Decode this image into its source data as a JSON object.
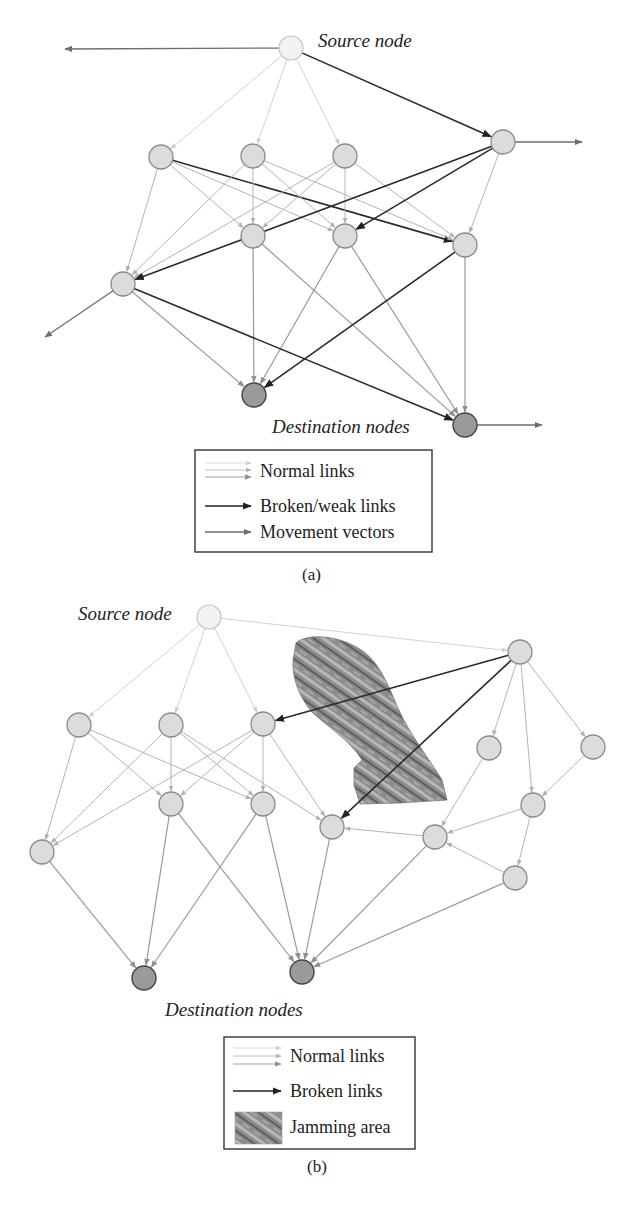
{
  "figure": {
    "panels": [
      {
        "id": "a",
        "caption": "(a)",
        "source_label": "Source node",
        "destination_label": "Destination nodes",
        "legend": {
          "items": [
            {
              "type": "normal",
              "label": "Normal links"
            },
            {
              "type": "broken",
              "label": "Broken/weak links"
            },
            {
              "type": "movement",
              "label": "Movement vectors"
            }
          ]
        }
      },
      {
        "id": "b",
        "caption": "(b)",
        "source_label": "Source node",
        "destination_label": "Destination nodes",
        "legend": {
          "items": [
            {
              "type": "normal",
              "label": "Normal links"
            },
            {
              "type": "broken",
              "label": "Broken links"
            },
            {
              "type": "jamming",
              "label": "Jamming area"
            }
          ]
        }
      }
    ]
  },
  "colors": {
    "normal_link_light": "#d2d2d2",
    "normal_link_mid": "#b4b4b4",
    "normal_link_dark": "#9a9a9a",
    "broken_link": "#2a2a2a",
    "movement_vector": "#6e6e6e",
    "node_fill": "#dcdcdc",
    "source_fill": "#f2f2f2",
    "dest_fill": "#9a9a9a",
    "jamming_fill": "#8a8a8a"
  },
  "diagram_a": {
    "nodes": [
      {
        "id": "S",
        "x": 291,
        "y": 48,
        "kind": "source"
      },
      {
        "id": "A1",
        "x": 161,
        "y": 157,
        "kind": "normal"
      },
      {
        "id": "A2",
        "x": 253,
        "y": 156,
        "kind": "normal"
      },
      {
        "id": "A3",
        "x": 345,
        "y": 156,
        "kind": "normal"
      },
      {
        "id": "R",
        "x": 503,
        "y": 142,
        "kind": "normal"
      },
      {
        "id": "B1",
        "x": 253,
        "y": 236,
        "kind": "normal"
      },
      {
        "id": "B2",
        "x": 345,
        "y": 236,
        "kind": "normal"
      },
      {
        "id": "B3",
        "x": 465,
        "y": 245,
        "kind": "normal"
      },
      {
        "id": "L",
        "x": 123,
        "y": 284,
        "kind": "normal"
      },
      {
        "id": "D1",
        "x": 254,
        "y": 395,
        "kind": "dest"
      },
      {
        "id": "D2",
        "x": 465,
        "y": 425,
        "kind": "dest"
      }
    ],
    "links": [
      {
        "from": "S",
        "to": "A1",
        "type": "light"
      },
      {
        "from": "S",
        "to": "A2",
        "type": "light"
      },
      {
        "from": "S",
        "to": "A3",
        "type": "light"
      },
      {
        "from": "S",
        "to": "R",
        "type": "broken"
      },
      {
        "from": "A1",
        "to": "L",
        "type": "mid"
      },
      {
        "from": "A1",
        "to": "B1",
        "type": "mid"
      },
      {
        "from": "A1",
        "to": "B2",
        "type": "mid"
      },
      {
        "from": "A1",
        "to": "B3",
        "type": "broken"
      },
      {
        "from": "A2",
        "to": "L",
        "type": "mid"
      },
      {
        "from": "A2",
        "to": "B1",
        "type": "mid"
      },
      {
        "from": "A2",
        "to": "B2",
        "type": "mid"
      },
      {
        "from": "A2",
        "to": "B3",
        "type": "mid"
      },
      {
        "from": "A3",
        "to": "L",
        "type": "mid"
      },
      {
        "from": "A3",
        "to": "B1",
        "type": "mid"
      },
      {
        "from": "A3",
        "to": "B2",
        "type": "mid"
      },
      {
        "from": "A3",
        "to": "B3",
        "type": "mid"
      },
      {
        "from": "R",
        "to": "B3",
        "type": "mid"
      },
      {
        "from": "R",
        "to": "L",
        "type": "broken"
      },
      {
        "from": "R",
        "to": "B2",
        "type": "broken"
      },
      {
        "from": "B1",
        "to": "D1",
        "type": "dark"
      },
      {
        "from": "B1",
        "to": "D2",
        "type": "dark"
      },
      {
        "from": "B2",
        "to": "D1",
        "type": "dark"
      },
      {
        "from": "B2",
        "to": "D2",
        "type": "dark"
      },
      {
        "from": "B3",
        "to": "D1",
        "type": "broken"
      },
      {
        "from": "B3",
        "to": "D2",
        "type": "dark"
      },
      {
        "from": "L",
        "to": "D1",
        "type": "dark"
      },
      {
        "from": "L",
        "to": "D2",
        "type": "broken"
      }
    ],
    "movement_vectors": [
      {
        "from": "S",
        "x2": 65,
        "y2": 49
      },
      {
        "from": "R",
        "x2": 582,
        "y2": 142
      },
      {
        "from": "L",
        "x2": 45,
        "y2": 337
      },
      {
        "from": "D2",
        "x2": 542,
        "y2": 425
      }
    ]
  },
  "diagram_b": {
    "nodes": [
      {
        "id": "S",
        "x": 209,
        "y": 617,
        "kind": "source"
      },
      {
        "id": "A1",
        "x": 79,
        "y": 725,
        "kind": "normal"
      },
      {
        "id": "A2",
        "x": 171,
        "y": 725,
        "kind": "normal"
      },
      {
        "id": "A3",
        "x": 263,
        "y": 724,
        "kind": "normal"
      },
      {
        "id": "B1",
        "x": 171,
        "y": 804,
        "kind": "normal"
      },
      {
        "id": "B2",
        "x": 263,
        "y": 804,
        "kind": "normal"
      },
      {
        "id": "L",
        "x": 42,
        "y": 852,
        "kind": "normal"
      },
      {
        "id": "C",
        "x": 332,
        "y": 827,
        "kind": "normal"
      },
      {
        "id": "R",
        "x": 520,
        "y": 652,
        "kind": "normal"
      },
      {
        "id": "R1",
        "x": 489,
        "y": 748,
        "kind": "normal"
      },
      {
        "id": "R2",
        "x": 593,
        "y": 747,
        "kind": "normal"
      },
      {
        "id": "R3",
        "x": 533,
        "y": 805,
        "kind": "normal"
      },
      {
        "id": "R4",
        "x": 435,
        "y": 837,
        "kind": "normal"
      },
      {
        "id": "R5",
        "x": 515,
        "y": 878,
        "kind": "normal"
      },
      {
        "id": "D1",
        "x": 144,
        "y": 978,
        "kind": "dest"
      },
      {
        "id": "D2",
        "x": 302,
        "y": 972,
        "kind": "dest"
      }
    ],
    "links": [
      {
        "from": "S",
        "to": "A1",
        "type": "light"
      },
      {
        "from": "S",
        "to": "A2",
        "type": "light"
      },
      {
        "from": "S",
        "to": "A3",
        "type": "light"
      },
      {
        "from": "S",
        "to": "R",
        "type": "light"
      },
      {
        "from": "A1",
        "to": "L",
        "type": "mid"
      },
      {
        "from": "A1",
        "to": "B1",
        "type": "mid"
      },
      {
        "from": "A1",
        "to": "B2",
        "type": "mid"
      },
      {
        "from": "A2",
        "to": "L",
        "type": "mid"
      },
      {
        "from": "A2",
        "to": "B1",
        "type": "mid"
      },
      {
        "from": "A2",
        "to": "B2",
        "type": "mid"
      },
      {
        "from": "A2",
        "to": "C",
        "type": "mid"
      },
      {
        "from": "A3",
        "to": "L",
        "type": "mid"
      },
      {
        "from": "A3",
        "to": "B1",
        "type": "mid"
      },
      {
        "from": "A3",
        "to": "B2",
        "type": "mid"
      },
      {
        "from": "A3",
        "to": "C",
        "type": "mid"
      },
      {
        "from": "R",
        "to": "A3",
        "type": "broken"
      },
      {
        "from": "R",
        "to": "C",
        "type": "broken"
      },
      {
        "from": "R",
        "to": "R1",
        "type": "mid"
      },
      {
        "from": "R",
        "to": "R2",
        "type": "mid"
      },
      {
        "from": "R",
        "to": "R3",
        "type": "mid"
      },
      {
        "from": "R1",
        "to": "R4",
        "type": "mid"
      },
      {
        "from": "R2",
        "to": "R3",
        "type": "mid"
      },
      {
        "from": "R3",
        "to": "R4",
        "type": "mid"
      },
      {
        "from": "R3",
        "to": "R5",
        "type": "mid"
      },
      {
        "from": "R4",
        "to": "C",
        "type": "mid"
      },
      {
        "from": "R5",
        "to": "R4",
        "type": "mid"
      },
      {
        "from": "L",
        "to": "D1",
        "type": "dark"
      },
      {
        "from": "B1",
        "to": "D1",
        "type": "dark"
      },
      {
        "from": "B2",
        "to": "D1",
        "type": "dark"
      },
      {
        "from": "B1",
        "to": "D2",
        "type": "dark"
      },
      {
        "from": "B2",
        "to": "D2",
        "type": "dark"
      },
      {
        "from": "C",
        "to": "D2",
        "type": "dark"
      },
      {
        "from": "R4",
        "to": "D2",
        "type": "dark"
      },
      {
        "from": "R5",
        "to": "D2",
        "type": "dark"
      }
    ],
    "jamming_area": "M 296 643 C 305 634, 335 634, 358 648 C 380 660, 390 690, 398 708 C 410 735, 430 760, 442 780 L 447 800 L 400 803 L 360 804 L 354 785 L 354 768 L 362 760 C 350 740, 325 725, 312 712 C 300 698, 292 680, 293 660 Z"
  }
}
